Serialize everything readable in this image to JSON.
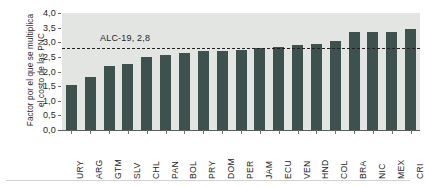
{
  "chart_data": {
    "type": "bar",
    "title": "",
    "subtitle": "",
    "xlabel": "",
    "ylabel_line1": "Factor por el que se multiplica",
    "ylabel_line2": "el costo de las PNC",
    "categories": [
      "URY",
      "ARG",
      "GTM",
      "SLV",
      "CHL",
      "PAN",
      "BOL",
      "PRY",
      "DOM",
      "PER",
      "JAM",
      "ECU",
      "VEN",
      "HND",
      "COL",
      "BRA",
      "NIC",
      "MEX",
      "CRI"
    ],
    "values": [
      1.55,
      1.8,
      2.2,
      2.25,
      2.5,
      2.55,
      2.65,
      2.7,
      2.7,
      2.75,
      2.8,
      2.85,
      2.9,
      2.95,
      3.05,
      3.35,
      3.35,
      3.35,
      3.45
    ],
    "ylim": [
      0.0,
      4.0
    ],
    "ytick_values": [
      0.0,
      0.5,
      1.0,
      1.5,
      2.0,
      2.5,
      3.0,
      3.5,
      4.0
    ],
    "ytick_labels": [
      "0,0",
      "0,5",
      "1,0",
      "1,5",
      "2,0",
      "2,5",
      "3,0",
      "3,5",
      "4,0"
    ],
    "grid": false,
    "legend": "none",
    "bar_color": "#3d514e",
    "plot_background": "#e3e5e2",
    "annotations": [
      {
        "name": "alc-19-reference-line",
        "label": "ALC-19, 2,8",
        "value": 2.8,
        "style": "dashed",
        "color": "#222222"
      }
    ]
  }
}
